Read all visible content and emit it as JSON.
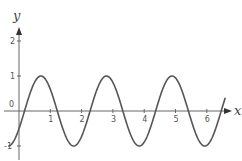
{
  "chart_data": {
    "type": "line",
    "title": "",
    "xlabel": "x",
    "ylabel": "y",
    "x_ticks": [
      "1",
      "2",
      "3",
      "4",
      "5",
      "6"
    ],
    "y_ticks": [
      "2",
      "1",
      "-1"
    ],
    "origin_label": "0",
    "xlim": [
      -0.6,
      6.7
    ],
    "ylim": [
      -1.6,
      2.6
    ],
    "grid": false,
    "series": [
      {
        "name": "y = sin(3x - 0.53)",
        "function": "sin(3x-0.53)",
        "x_range": [
          -0.35,
          6.6
        ],
        "color": "#555555"
      }
    ],
    "key_points": {
      "maxima_x": [
        0.7,
        2.8,
        4.9
      ],
      "minima_x": [
        1.75,
        3.85,
        5.94
      ],
      "amplitude": 1,
      "period_approx": 2.09
    }
  }
}
